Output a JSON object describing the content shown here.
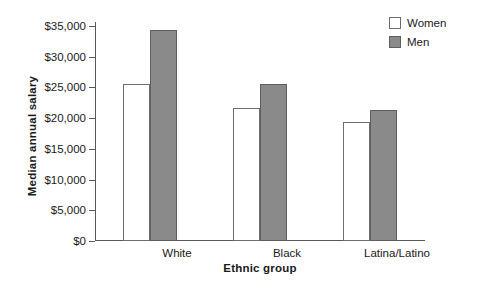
{
  "chart_data": {
    "type": "bar",
    "title": "",
    "xlabel": "Ethnic group",
    "ylabel": "Median annual salary",
    "categories": [
      "White",
      "Black",
      "Latina/Latino"
    ],
    "series": [
      {
        "name": "Women",
        "values": [
          25600,
          21700,
          19400
        ],
        "fill": "#ffffff",
        "stroke": "#6e6e6e"
      },
      {
        "name": "Men",
        "values": [
          34400,
          25600,
          21400
        ],
        "fill": "#8a8a8a",
        "stroke": "#5e5e5e"
      }
    ],
    "ylim": [
      0,
      35000
    ],
    "ytick_values": [
      0,
      5000,
      10000,
      15000,
      20000,
      25000,
      30000,
      35000
    ],
    "ytick_labels": [
      "$0",
      "$5,000",
      "$10,000",
      "$15,000",
      "$20,000",
      "$25,000",
      "$30,000",
      "$35,000"
    ],
    "grid": false,
    "legend_position": "top-right",
    "legend_entries": [
      "Women",
      "Men"
    ]
  },
  "axes": {
    "y_title": "Median annual salary",
    "x_title": "Ethnic group"
  }
}
